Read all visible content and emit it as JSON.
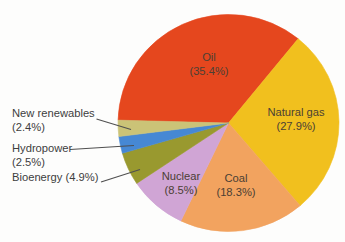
{
  "figure": {
    "background": "#fdfdfc"
  },
  "chart_data": {
    "type": "pie",
    "title": "",
    "legend_position": "none",
    "direction": "clockwise",
    "start_angle_deg": 271.5,
    "slices": [
      {
        "id": "oil",
        "label": "Oil",
        "value": 35.4,
        "color": "#e5471e",
        "label_placement": "inside"
      },
      {
        "id": "natural-gas",
        "label": "Natural gas",
        "value": 27.9,
        "color": "#f1c01e",
        "label_placement": "inside"
      },
      {
        "id": "coal",
        "label": "Coal",
        "value": 18.3,
        "color": "#f2a35f",
        "label_placement": "inside"
      },
      {
        "id": "nuclear",
        "label": "Nuclear",
        "value": 8.5,
        "color": "#d0a5d5",
        "label_placement": "inside"
      },
      {
        "id": "bioenergy",
        "label": "Bioenergy",
        "value": 4.9,
        "color": "#99992f",
        "label_placement": "callout"
      },
      {
        "id": "hydropower",
        "label": "Hydropower",
        "value": 2.5,
        "color": "#4688d4",
        "label_placement": "callout"
      },
      {
        "id": "new-renewables",
        "label": "New renewables",
        "value": 2.4,
        "color": "#cbc377",
        "label_placement": "callout"
      }
    ],
    "inside_labels": [
      {
        "slice": "oil",
        "line1": "Oil",
        "line2": "(35.4%)"
      },
      {
        "slice": "natural-gas",
        "line1": "Natural gas",
        "line2": "(27.9%)"
      },
      {
        "slice": "coal",
        "line1": "Coal",
        "line2": "(18.3%)"
      },
      {
        "slice": "nuclear",
        "line1": "Nuclear",
        "line2": "(8.5%)"
      }
    ],
    "callouts": [
      {
        "slice": "new-renewables",
        "line1": "New renewables",
        "line2": "(2.4%)"
      },
      {
        "slice": "hydropower",
        "line1": "Hydropower",
        "line2": "(2.5%)"
      },
      {
        "slice": "bioenergy",
        "line1": "Bioenergy (4.9%)",
        "line2": ""
      }
    ]
  }
}
